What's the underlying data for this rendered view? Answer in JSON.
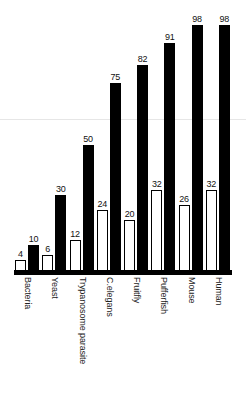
{
  "chart_data": {
    "type": "bar",
    "title": "",
    "subtitle": "",
    "xlabel": "",
    "ylabel": "",
    "ylim": [
      0,
      105
    ],
    "grid": false,
    "legend_position": "none",
    "categories": [
      "Bacteria",
      "Yeast",
      "Trypanosome parasite",
      "C.elegans",
      "Fruitfly",
      "Pufferfish",
      "Mouse",
      "Human"
    ],
    "series": [
      {
        "name": "open-bar",
        "style": "white-outlined",
        "color": "#ffffff",
        "edgecolor": "#000000",
        "values": [
          4,
          6,
          12,
          24,
          20,
          32,
          26,
          32
        ]
      },
      {
        "name": "filled-bar",
        "style": "solid-black",
        "color": "#000000",
        "edgecolor": "#000000",
        "values": [
          10,
          30,
          50,
          75,
          82,
          91,
          98,
          98
        ]
      }
    ],
    "data_labels": true,
    "axis_color": "#000000"
  },
  "colors": {
    "background": "#ffffff",
    "ink": "#000000",
    "label_text": "#222222",
    "value_text": "#111111",
    "scanline": "#e6e6e6"
  }
}
